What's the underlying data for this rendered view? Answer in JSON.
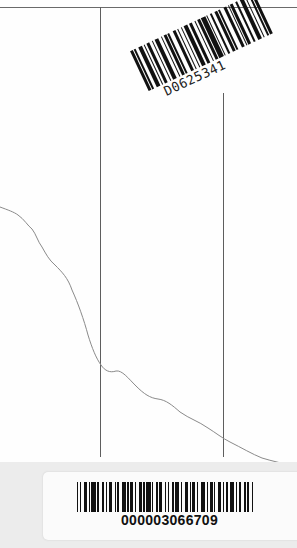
{
  "page": {
    "type": "scanned book endpaper",
    "top_barcode": {
      "text": "D0625341",
      "rotation_deg": -25,
      "pattern": [
        2,
        1,
        1,
        2,
        3,
        1,
        1,
        1,
        2,
        2,
        1,
        1,
        3,
        2,
        1,
        1,
        2,
        1,
        1,
        3,
        2,
        1,
        1,
        2,
        1,
        1,
        3,
        1,
        2,
        2,
        1,
        1,
        2,
        1,
        3,
        1,
        1,
        2,
        1,
        2,
        2,
        1,
        1,
        3,
        2,
        1,
        1,
        1,
        2,
        2,
        1,
        2,
        3,
        1,
        1,
        2,
        1,
        1,
        2,
        2
      ]
    },
    "bottom_barcode": {
      "text": "000003066709",
      "pattern": [
        1,
        1,
        1,
        2,
        2,
        1,
        1,
        1,
        3,
        1,
        1,
        2,
        2,
        1,
        1,
        1,
        2,
        2,
        1,
        1,
        1,
        2,
        3,
        1,
        1,
        1,
        2,
        1,
        1,
        2,
        2,
        1,
        1,
        1,
        3,
        1,
        1,
        2,
        1,
        1,
        2,
        2,
        1,
        1,
        1,
        2,
        1,
        1,
        3,
        1,
        1,
        2,
        2,
        1,
        1,
        1,
        2,
        1,
        1,
        2,
        3,
        1,
        1,
        1,
        2,
        1,
        1,
        2,
        2,
        1,
        1,
        1,
        2,
        1,
        3,
        1,
        1,
        1,
        2,
        2,
        1,
        1,
        1,
        2,
        1,
        1
      ]
    },
    "colors": {
      "paper": "#fefefe",
      "line": "#6a6a6a",
      "curve": "#8a8a8a",
      "ink": "#111111",
      "background_grey": "#ececec"
    }
  }
}
